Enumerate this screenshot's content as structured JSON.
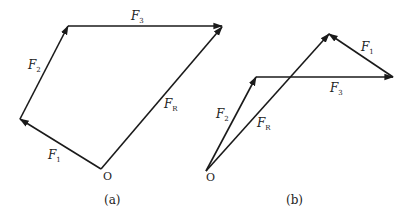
{
  "figure": {
    "panels": [
      {
        "id": "a",
        "caption": "(a)",
        "origin_label": "O",
        "vectors": [
          {
            "name": "F1",
            "symbol": "F",
            "subscript": "1"
          },
          {
            "name": "F2",
            "symbol": "F",
            "subscript": "2"
          },
          {
            "name": "F3",
            "symbol": "F",
            "subscript": "3"
          },
          {
            "name": "FR",
            "symbol": "F",
            "subscript": "R"
          }
        ],
        "construction": "polygon: F1 then F2 then F3 head-to-tail from O; FR closes from O"
      },
      {
        "id": "b",
        "caption": "(b)",
        "origin_label": "O",
        "vectors": [
          {
            "name": "F2",
            "symbol": "F",
            "subscript": "2"
          },
          {
            "name": "F3",
            "symbol": "F",
            "subscript": "3"
          },
          {
            "name": "F1",
            "symbol": "F",
            "subscript": "1"
          },
          {
            "name": "FR",
            "symbol": "F",
            "subscript": "R"
          }
        ],
        "construction": "polygon: F2 then F3 then F1 head-to-tail from O; FR from O to apex"
      }
    ],
    "line_color": "#1a1a1a",
    "background": "#ffffff"
  }
}
